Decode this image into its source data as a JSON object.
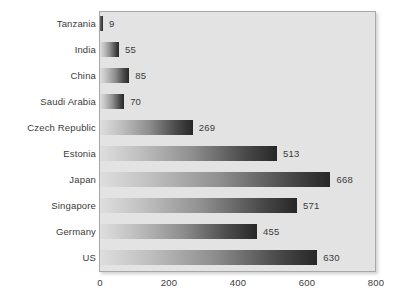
{
  "chart_data": {
    "type": "bar",
    "orientation": "horizontal",
    "title": "",
    "xlabel": "",
    "ylabel": "",
    "categories": [
      "Tanzania",
      "India",
      "China",
      "Saudi Arabia",
      "Czech Republic",
      "Estonia",
      "Japan",
      "Singapore",
      "Germany",
      "US"
    ],
    "values": [
      9,
      55,
      85,
      70,
      269,
      513,
      668,
      571,
      455,
      630
    ],
    "value_labels": [
      "9",
      "55",
      "85",
      "70",
      "269",
      "513",
      "668",
      "571",
      "455",
      "630"
    ],
    "xlim": [
      0,
      800
    ],
    "xticks": [
      0,
      200,
      400,
      600,
      800
    ],
    "xtick_labels": [
      "0",
      "200",
      "400",
      "600",
      "800"
    ],
    "grid": false,
    "legend": null,
    "bar_gradient_start": "#dedede",
    "bar_gradient_end": "#272727",
    "plot_background": "#e3e3e3",
    "text_color": "#3b3b3b"
  }
}
